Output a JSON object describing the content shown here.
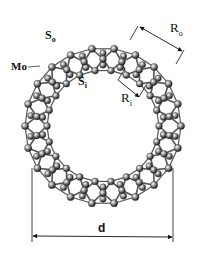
{
  "figure": {
    "labels": {
      "s_outer": {
        "main": "S",
        "sub": "o"
      },
      "s_inner": {
        "main": "S",
        "sub": "i"
      },
      "mo": {
        "main": "Mo",
        "sub": ""
      },
      "r_outer": {
        "main": "R",
        "sub": "o"
      },
      "r_inner": {
        "main": "R",
        "sub": "i"
      },
      "diameter": {
        "main": "d",
        "sub": ""
      }
    },
    "ring": {
      "units": 22,
      "colors": {
        "atom": "#9a9a9a",
        "atom_dark": "#2a2a2a",
        "bond": "#555555",
        "line": "#111111"
      }
    }
  }
}
